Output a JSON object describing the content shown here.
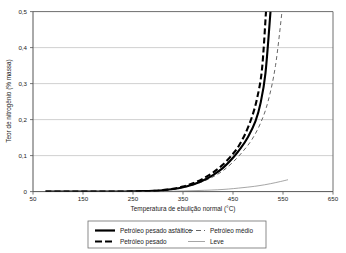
{
  "chart_data": {
    "type": "line",
    "title": "",
    "xlabel": "Temperatura de ebulição normal (°C)",
    "ylabel": "Teor de nitrogênio (% massa)",
    "xlim": [
      50,
      650
    ],
    "ylim": [
      0,
      0.5
    ],
    "grid": "horizontal",
    "xticks": [
      "50",
      "150",
      "250",
      "350",
      "450",
      "550",
      "650"
    ],
    "xtick_values": [
      50,
      150,
      250,
      350,
      450,
      550,
      650
    ],
    "yticks": [
      "0",
      "0,1",
      "0,2",
      "0,3",
      "0,4",
      "0,5"
    ],
    "ytick_values": [
      0,
      0.1,
      0.2,
      0.3,
      0.4,
      0.5
    ],
    "legend_position": "below-center",
    "series": [
      {
        "name": "Petróleo pesado asfáltico",
        "style": "solid",
        "width": "thick",
        "color": "#000000",
        "x": [
          75,
          120,
          170,
          220,
          260,
          290,
          310,
          330,
          350,
          370,
          390,
          410,
          430,
          450,
          465,
          480,
          495,
          505,
          515,
          525
        ],
        "y": [
          0.0,
          0.0,
          0.0,
          0.0,
          0.001,
          0.002,
          0.004,
          0.007,
          0.012,
          0.02,
          0.031,
          0.046,
          0.066,
          0.094,
          0.12,
          0.152,
          0.196,
          0.245,
          0.33,
          0.5
        ]
      },
      {
        "name": "Petróleo pesado",
        "style": "dashed",
        "width": "thick",
        "color": "#000000",
        "x": [
          75,
          120,
          170,
          220,
          260,
          290,
          310,
          330,
          350,
          370,
          390,
          410,
          430,
          450,
          462,
          475,
          488,
          498,
          508,
          516
        ],
        "y": [
          0.0,
          0.0,
          0.0,
          0.0,
          0.001,
          0.002,
          0.004,
          0.008,
          0.014,
          0.023,
          0.036,
          0.053,
          0.075,
          0.105,
          0.128,
          0.162,
          0.208,
          0.258,
          0.34,
          0.5
        ]
      },
      {
        "name": "Petróleo médio",
        "style": "dashed",
        "width": "thin",
        "color": "#555555",
        "x": [
          75,
          120,
          170,
          220,
          260,
          290,
          310,
          330,
          350,
          370,
          390,
          410,
          430,
          450,
          470,
          488,
          505,
          520,
          535,
          548
        ],
        "y": [
          0.0,
          0.0,
          0.0,
          0.0,
          0.001,
          0.002,
          0.003,
          0.006,
          0.011,
          0.018,
          0.028,
          0.041,
          0.058,
          0.082,
          0.112,
          0.145,
          0.19,
          0.25,
          0.35,
          0.5
        ]
      },
      {
        "name": "Leve",
        "style": "solid",
        "width": "thin",
        "color": "#888888",
        "x": [
          75,
          150,
          250,
          320,
          380,
          430,
          470,
          500,
          525,
          545,
          560
        ],
        "y": [
          0.0,
          0.0,
          0.0,
          0.001,
          0.003,
          0.006,
          0.011,
          0.016,
          0.022,
          0.028,
          0.033
        ]
      }
    ]
  },
  "legend": {
    "items": [
      {
        "label": "Petróleo pesado asfáltico",
        "swatch": "solid-thick"
      },
      {
        "label": "Petróleo médio",
        "swatch": "dashed-thin"
      },
      {
        "label": "Petróleo pesado",
        "swatch": "dashed-thick"
      },
      {
        "label": "Leve",
        "swatch": "solid-thin"
      }
    ]
  },
  "colors": {
    "axis": "#6e6e6e",
    "grid": "#bdbdbd",
    "frame": "#6e6e6e",
    "primary": "#000000",
    "secondary": "#555555",
    "tertiary": "#888888"
  }
}
